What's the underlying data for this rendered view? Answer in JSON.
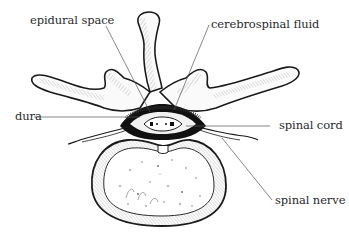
{
  "diagram": {
    "labels": [
      {
        "id": "epidural-space",
        "text": "epidural space"
      },
      {
        "id": "cerebrospinal-fluid",
        "text": "cerebrospinal fluid"
      },
      {
        "id": "dura",
        "text": "dura"
      },
      {
        "id": "spinal-cord",
        "text": "spinal cord"
      },
      {
        "id": "spinal-nerve",
        "text": "spinal nerve"
      }
    ],
    "colors": {
      "ink": "#1a1a1a",
      "leader": "#555555",
      "background": "#ffffff"
    }
  }
}
